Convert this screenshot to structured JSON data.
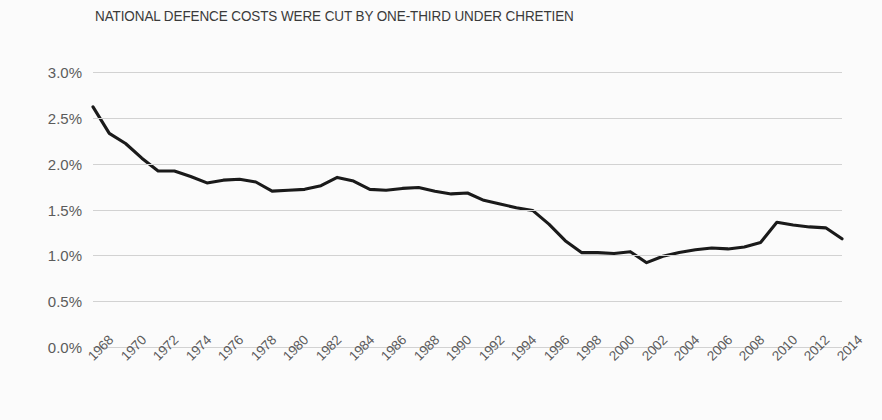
{
  "chart_data": {
    "type": "line",
    "title": "NATIONAL DEFENCE COSTS WERE CUT BY ONE-THIRD UNDER CHRETIEN",
    "xlabel": "",
    "ylabel": "",
    "ylim": [
      0,
      3.0
    ],
    "xlim": [
      1968,
      2014
    ],
    "y_tick_labels": [
      "3.0%",
      "2.5%",
      "2.0%",
      "1.5%",
      "1.0%",
      "0.5%",
      "0.0%"
    ],
    "y_tick_values": [
      3.0,
      2.5,
      2.0,
      1.5,
      1.0,
      0.5,
      0.0
    ],
    "x_tick_labels": [
      "1968",
      "1970",
      "1972",
      "1974",
      "1976",
      "1978",
      "1980",
      "1982",
      "1984",
      "1986",
      "1988",
      "1990",
      "1992",
      "1994",
      "1996",
      "1998",
      "2000",
      "2002",
      "2004",
      "2006",
      "2008",
      "2010",
      "2012",
      "2014"
    ],
    "grid": true,
    "legend": "none",
    "line_color": "#1a1a1a",
    "grid_color": "#d2d2d2",
    "background_color": "#fbfbfb",
    "units": "percent of GDP",
    "x": [
      1968,
      1969,
      1970,
      1971,
      1972,
      1973,
      1974,
      1975,
      1976,
      1977,
      1978,
      1979,
      1980,
      1981,
      1982,
      1983,
      1984,
      1985,
      1986,
      1987,
      1988,
      1989,
      1990,
      1991,
      1992,
      1993,
      1994,
      1995,
      1996,
      1997,
      1998,
      1999,
      2000,
      2001,
      2002,
      2003,
      2004,
      2005,
      2006,
      2007,
      2008,
      2009,
      2010,
      2011,
      2012,
      2013,
      2014
    ],
    "values": [
      2.62,
      2.33,
      2.22,
      2.06,
      1.92,
      1.92,
      1.86,
      1.79,
      1.82,
      1.83,
      1.8,
      1.7,
      1.71,
      1.72,
      1.76,
      1.85,
      1.81,
      1.72,
      1.71,
      1.73,
      1.74,
      1.7,
      1.67,
      1.68,
      1.6,
      1.56,
      1.52,
      1.49,
      1.34,
      1.16,
      1.03,
      1.03,
      1.02,
      1.04,
      0.92,
      0.99,
      1.03,
      1.06,
      1.08,
      1.07,
      1.09,
      1.14,
      1.36,
      1.33,
      1.31,
      1.3,
      1.18
    ]
  },
  "figure": {
    "title": "NATIONAL DEFENCE COSTS WERE CUT BY ONE-THIRD UNDER CHRETIEN"
  }
}
